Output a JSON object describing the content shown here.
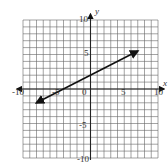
{
  "chart_data": {
    "type": "line",
    "title": "",
    "xlabel": "x",
    "ylabel": "y",
    "xlim": [
      -10,
      10
    ],
    "ylim": [
      -10,
      10
    ],
    "grid": true,
    "grid_step": 1,
    "x_ticks": [
      -10,
      -5,
      0,
      5,
      10
    ],
    "y_ticks": [
      -10,
      -5,
      5,
      10
    ],
    "x_tick_labels": [
      "-10",
      "-5",
      "0",
      "5",
      "10"
    ],
    "y_tick_labels": [
      "-10",
      "-5",
      "5",
      "10"
    ],
    "series": [
      {
        "name": "line",
        "equation": "y = 0.5x + 2",
        "x": [
          -8,
          7
        ],
        "y": [
          -2,
          5.5
        ],
        "arrows": "both"
      }
    ]
  },
  "labels": {
    "x_axis": "x",
    "y_axis": "y",
    "t_neg10": "-10",
    "t_neg5": "-5",
    "t_0": "0",
    "t_5": "5",
    "t_10": "10",
    "ty_10": "10",
    "ty_5": "5",
    "ty_neg5": "-5",
    "ty_neg10": "-10"
  },
  "colors": {
    "grid": "#555555",
    "axis": "#222222",
    "line": "#111111"
  }
}
